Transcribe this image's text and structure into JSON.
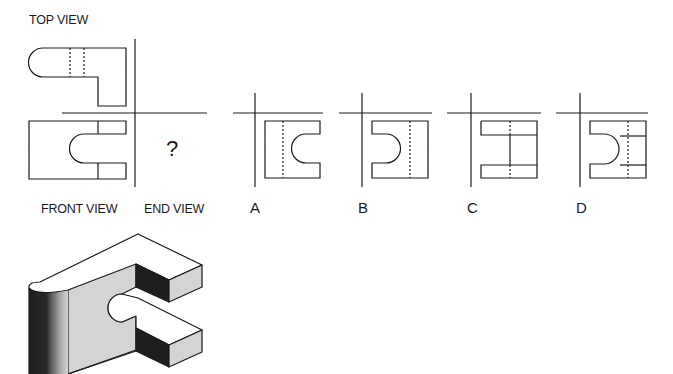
{
  "labels": {
    "top_view": "TOP VIEW",
    "front_view": "FRONT VIEW",
    "end_view": "END VIEW",
    "unknown": "?"
  },
  "options": [
    {
      "key": "A",
      "label": "A"
    },
    {
      "key": "B",
      "label": "B"
    },
    {
      "key": "C",
      "label": "C"
    },
    {
      "key": "D",
      "label": "D"
    }
  ],
  "colors": {
    "line": "#1a1a1a",
    "face_dark": "#1e1e1e",
    "face_light": "#d4d4d4",
    "face_top": "#ffffff"
  }
}
